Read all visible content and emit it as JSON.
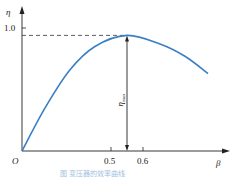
{
  "chart_data": {
    "type": "line",
    "title": "",
    "caption": "图 变压器的效率曲线",
    "xlabel": "β",
    "ylabel": "η",
    "origin_label": "O",
    "x_ticks": [
      {
        "value": 0.5,
        "label": "0.5"
      },
      {
        "value": 0.6,
        "label": "0.6"
      }
    ],
    "y_ticks": [
      {
        "value": 1.0,
        "label": "1.0"
      }
    ],
    "xlim": [
      0,
      1.0
    ],
    "ylim": [
      0,
      1.15
    ],
    "grid": false,
    "series": [
      {
        "name": "η(β)",
        "color": "#3a7fc4",
        "x": [
          0,
          0.123,
          0.256,
          0.389,
          0.56,
          0.736,
          0.869,
          0.992
        ],
        "y": [
          0,
          0.35,
          0.66,
          0.85,
          0.94,
          0.87,
          0.77,
          0.63
        ]
      }
    ],
    "annotations": [
      {
        "type": "dashed-hline",
        "y": 0.94,
        "from_x": 0,
        "to_x": 0.56
      },
      {
        "type": "vertical-arrow",
        "x": 0.56,
        "from_y": 0.94,
        "to_y": 0,
        "label": "η_max"
      }
    ],
    "peak": {
      "x": 0.56,
      "y": 0.94,
      "label": "η_max"
    }
  }
}
